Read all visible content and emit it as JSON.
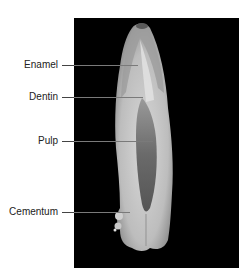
{
  "figure": {
    "background_color": "#000000",
    "labels": [
      {
        "text": "Enamel",
        "y": 65,
        "line_end_x": 138
      },
      {
        "text": "Dentin",
        "y": 97,
        "line_end_x": 143
      },
      {
        "text": "Pulp",
        "y": 141,
        "line_end_x": 153
      },
      {
        "text": "Cementum",
        "y": 212,
        "line_end_x": 130
      }
    ]
  }
}
